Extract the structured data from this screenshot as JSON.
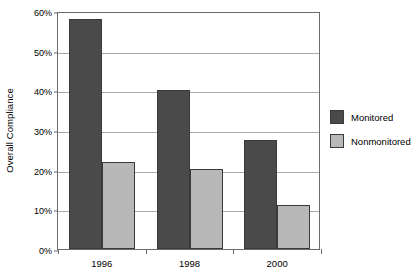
{
  "chart_data": {
    "type": "bar",
    "title": "",
    "xlabel": "",
    "ylabel": "Overall Compliance",
    "categories": [
      "1996",
      "1998",
      "2000"
    ],
    "series": [
      {
        "name": "Monitored",
        "color": "#4a4a4a",
        "values": [
          58,
          40,
          27.5
        ]
      },
      {
        "name": "Nonmonitored",
        "color": "#b8b8b8",
        "values": [
          22,
          20.2,
          11
        ]
      }
    ],
    "ylim": [
      0,
      60
    ],
    "ytick_values": [
      0,
      10,
      20,
      30,
      40,
      50,
      60
    ],
    "ytick_labels": [
      "0%",
      "10%",
      "20%",
      "30%",
      "40%",
      "50%",
      "60%"
    ],
    "grid": true,
    "legend_position": "right",
    "plot_background": "#ffffff",
    "gridline_color": "#a9a9a9",
    "axis_color": "#6b6b6b"
  },
  "legend": {
    "entries": [
      {
        "label": "Monitored",
        "color": "#4a4a4a"
      },
      {
        "label": "Nonmonitored",
        "color": "#b8b8b8"
      }
    ]
  }
}
